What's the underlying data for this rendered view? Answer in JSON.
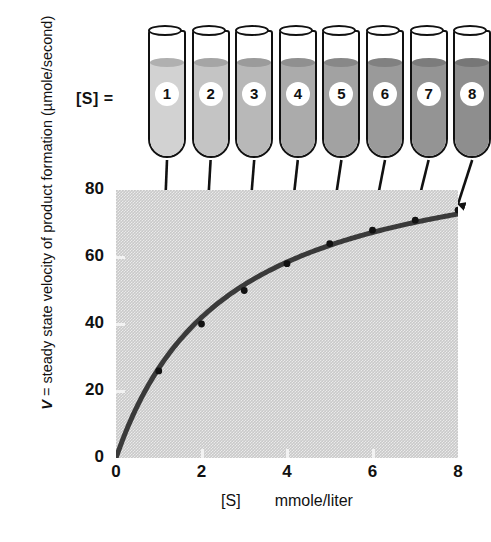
{
  "chart_data": {
    "type": "line",
    "title": "",
    "subtitle": "",
    "xlabel_concentration": "[S]",
    "xlabel_units": "mmole/liter",
    "ylabel": "V = steady state velocity of product formation (µmole/second)",
    "ylabel_symbol": "V",
    "ylabel_rest": " = steady state velocity of product formation (µmole/second)",
    "x": [
      1,
      2,
      3,
      4,
      5,
      6,
      7,
      8
    ],
    "values": [
      26,
      40,
      50,
      58,
      64,
      68,
      71,
      74
    ],
    "xlim": [
      0,
      8
    ],
    "ylim": [
      0,
      80
    ],
    "xticks": [
      "0",
      "2",
      "4",
      "6",
      "8"
    ],
    "xtick_values": [
      0,
      2,
      4,
      6,
      8
    ],
    "yticks": [
      "0",
      "20",
      "40",
      "60",
      "80"
    ],
    "ytick_values": [
      0,
      20,
      40,
      60,
      80
    ],
    "grid": false,
    "legend": "none",
    "curve_color": "#3a3a3a",
    "plot_background_color": "#c9c9c9",
    "annotation": "Arrows connect each substrate tube to its measured steady-state velocity on the saturation curve",
    "vmax_asymptote": 80
  },
  "rack": {
    "label": "[S] =",
    "tubes": [
      {
        "number": "1",
        "fill_color": "#d2d2d2"
      },
      {
        "number": "2",
        "fill_color": "#c4c4c4"
      },
      {
        "number": "3",
        "fill_color": "#b8b8b8"
      },
      {
        "number": "4",
        "fill_color": "#ababab"
      },
      {
        "number": "5",
        "fill_color": "#a2a2a2"
      },
      {
        "number": "6",
        "fill_color": "#9a9a9a"
      },
      {
        "number": "7",
        "fill_color": "#949494"
      },
      {
        "number": "8",
        "fill_color": "#8e8e8e"
      }
    ]
  }
}
